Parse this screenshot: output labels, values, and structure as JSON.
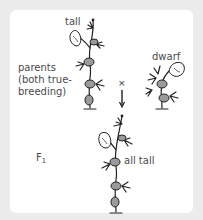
{
  "diagram": {
    "labels": {
      "parents": "parents (both true-breeding)",
      "tall_parent": "tall",
      "dwarf_parent": "dwarf",
      "cross_symbol": "×",
      "f1_generation_main": "F",
      "f1_generation_sub": "1",
      "f1_result": "all tall"
    },
    "nodes": [
      {
        "id": "tall-parent",
        "label": "tall",
        "type": "plant"
      },
      {
        "id": "dwarf-parent",
        "label": "dwarf",
        "type": "plant"
      },
      {
        "id": "f1-offspring",
        "label": "all tall",
        "type": "plant"
      }
    ],
    "edges": [
      {
        "from": "tall-parent",
        "to": "f1-offspring",
        "label": "×"
      },
      {
        "from": "dwarf-parent",
        "to": "f1-offspring",
        "label": "×"
      }
    ],
    "colors": {
      "background": "#ececec",
      "card": "#ffffff",
      "text": "#4a4a4a",
      "line": "#222222",
      "pod_fill": "#9a9a9a"
    }
  }
}
